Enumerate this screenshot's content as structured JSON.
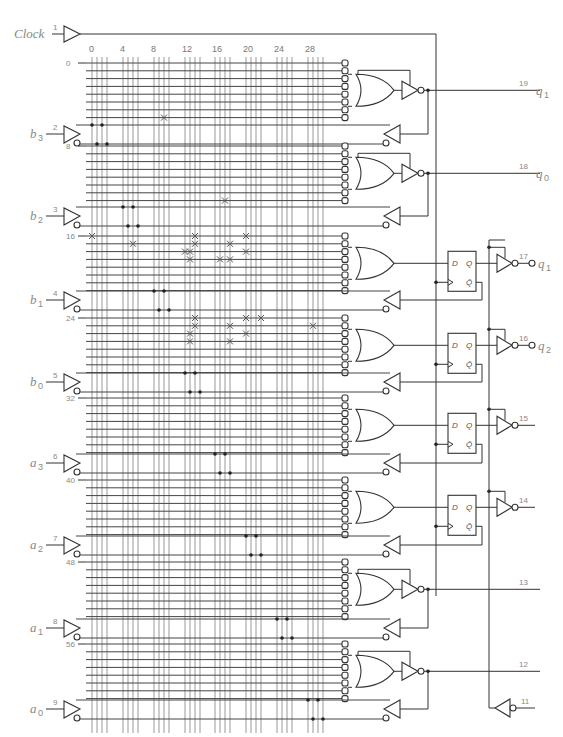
{
  "clock": {
    "label": "Clock",
    "pin": "1"
  },
  "column_labels": [
    "0",
    "4",
    "8",
    "12",
    "16",
    "20",
    "24",
    "28"
  ],
  "inputs": [
    {
      "name": "b",
      "sub": "3",
      "pin": "2"
    },
    {
      "name": "b",
      "sub": "2",
      "pin": "3"
    },
    {
      "name": "b",
      "sub": "1",
      "pin": "4"
    },
    {
      "name": "b",
      "sub": "0",
      "pin": "5"
    },
    {
      "name": "a",
      "sub": "3",
      "pin": "6"
    },
    {
      "name": "a",
      "sub": "2",
      "pin": "7"
    },
    {
      "name": "a",
      "sub": "1",
      "pin": "8"
    },
    {
      "name": "a",
      "sub": "0",
      "pin": "9"
    }
  ],
  "row_labels": [
    "0",
    "8",
    "16",
    "24",
    "32",
    "40",
    "48",
    "56"
  ],
  "macrocells": [
    {
      "type": "comb",
      "pin": "19",
      "out_name": "q",
      "out_sub": "1"
    },
    {
      "type": "comb",
      "pin": "18",
      "out_name": "q",
      "out_sub": "0"
    },
    {
      "type": "reg",
      "pin": "17",
      "out_name": "q",
      "out_sub": "1"
    },
    {
      "type": "reg",
      "pin": "16",
      "out_name": "q",
      "out_sub": "2"
    },
    {
      "type": "reg",
      "pin": "15",
      "out_name": "",
      "out_sub": ""
    },
    {
      "type": "reg",
      "pin": "14",
      "out_name": "",
      "out_sub": ""
    },
    {
      "type": "comb",
      "pin": "13",
      "out_name": "",
      "out_sub": ""
    },
    {
      "type": "comb",
      "pin": "12",
      "out_name": "",
      "out_sub": ""
    }
  ],
  "oe_pin": "11",
  "flipflop_labels": {
    "d": "D",
    "q": "Q",
    "qbar": "Q̄"
  },
  "fuses": [
    {
      "row": 7,
      "col": 10
    },
    {
      "row": 15,
      "col": 18
    },
    {
      "row": 16,
      "col": 0
    },
    {
      "row": 16,
      "col": 14
    },
    {
      "row": 16,
      "col": 20
    },
    {
      "row": 17,
      "col": 6
    },
    {
      "row": 17,
      "col": 14
    },
    {
      "row": 17,
      "col": 19
    },
    {
      "row": 18,
      "col": 12
    },
    {
      "row": 18,
      "col": 13
    },
    {
      "row": 18,
      "col": 20
    },
    {
      "row": 19,
      "col": 13
    },
    {
      "row": 19,
      "col": 17
    },
    {
      "row": 19,
      "col": 19
    },
    {
      "row": 24,
      "col": 14
    },
    {
      "row": 24,
      "col": 20
    },
    {
      "row": 24,
      "col": 23
    },
    {
      "row": 25,
      "col": 14
    },
    {
      "row": 25,
      "col": 19
    },
    {
      "row": 25,
      "col": 29
    },
    {
      "row": 26,
      "col": 13
    },
    {
      "row": 26,
      "col": 20
    },
    {
      "row": 26,
      "col": 35
    },
    {
      "row": 27,
      "col": 13
    },
    {
      "row": 27,
      "col": 19
    },
    {
      "row": 27,
      "col": 41
    }
  ]
}
